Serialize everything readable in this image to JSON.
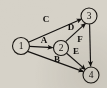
{
  "diagram": {
    "background_color": "#d6d2c8",
    "stroke_color": "#141210",
    "node_fill_color": "#d8d4ca",
    "nodes": [
      {
        "id": "1",
        "label": "1",
        "cx": 21,
        "cy": 46,
        "r": 8.5
      },
      {
        "id": "2",
        "label": "2",
        "cx": 61,
        "cy": 48,
        "r": 7.5
      },
      {
        "id": "3",
        "label": "3",
        "cx": 89,
        "cy": 16,
        "r": 8.0
      },
      {
        "id": "4",
        "label": "4",
        "cx": 91,
        "cy": 75,
        "r": 8.0
      }
    ],
    "edges": [
      {
        "id": "A",
        "label": "A",
        "from": "1",
        "to": "2",
        "directed": true,
        "label_x": 44,
        "label_y": 40
      },
      {
        "id": "B",
        "label": "B",
        "from": "1",
        "to": "4",
        "directed": true,
        "label_x": 57,
        "label_y": 59
      },
      {
        "id": "C",
        "label": "C",
        "from": "1",
        "to": "3",
        "directed": true,
        "label_x": 46,
        "label_y": 19
      },
      {
        "id": "D",
        "label": "D",
        "from": "2",
        "to": "3",
        "directed": true,
        "label_x": 71,
        "label_y": 27
      },
      {
        "id": "E",
        "label": "E",
        "from": "2",
        "to": "4",
        "directed": true,
        "label_x": 76,
        "label_y": 51
      },
      {
        "id": "F",
        "label": "F",
        "from": "3",
        "to": "4",
        "directed": true,
        "label_x": 80,
        "label_y": 39
      }
    ]
  }
}
